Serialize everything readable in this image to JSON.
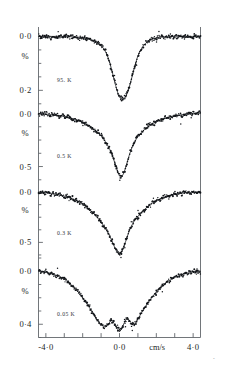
{
  "figure": {
    "type": "moessbauer-spectra-stack",
    "x_axis": {
      "unit_label": "cm/s",
      "tick_labels": [
        "-4·0",
        "0·0",
        "4·0"
      ],
      "tick_values": [
        -4.0,
        0.0,
        4.0
      ],
      "range": [
        -4.4,
        4.4
      ],
      "minor_tick_step": 1.0,
      "n_ticks": 9
    },
    "y_axis_unit": "%",
    "panels": [
      {
        "id": "panel-95k",
        "temperature_label": "95. K",
        "y_top_label": "0·0",
        "y_bottom_label": "0·2",
        "percent_label": "%",
        "y_top_value": 0.0,
        "y_bottom_value": 0.2,
        "depth_percent": 0.235,
        "line_shape": "single-narrow-lorentzian",
        "center_cm_s": 0.25,
        "width_cm_s": 0.95
      },
      {
        "id": "panel-0p5k",
        "temperature_label": "0.5 K",
        "y_top_label": "0·0",
        "y_bottom_label": "0·5",
        "percent_label": "%",
        "y_top_value": 0.0,
        "y_bottom_value": 0.5,
        "depth_percent": 0.6,
        "line_shape": "broadened-single-with-wings",
        "center_cm_s": 0.1,
        "width_cm_s": 1.5
      },
      {
        "id": "panel-0p3k",
        "temperature_label": "0.3 K",
        "y_top_label": "0·0",
        "y_bottom_label": "0·5",
        "percent_label": "%",
        "y_top_value": 0.0,
        "y_bottom_value": 0.5,
        "depth_percent": 0.62,
        "line_shape": "v-shaped-broad-wings",
        "center_cm_s": 0.1,
        "width_cm_s": 2.2
      },
      {
        "id": "panel-0p05k",
        "temperature_label": "0.05 K",
        "y_top_label": "0·0",
        "y_bottom_label": "0·4",
        "percent_label": "%",
        "y_top_value": 0.0,
        "y_bottom_value": 0.4,
        "depth_percent": 0.46,
        "line_shape": "magnetically-split-multiline",
        "center_cm_s": 0.0,
        "width_cm_s": 3.4
      }
    ],
    "corner_mark": "•"
  },
  "chart_data": {
    "type": "line",
    "title": "",
    "xlabel": "cm/s",
    "ylabel": "%",
    "xlim": [
      -4.4,
      4.4
    ],
    "grid": false,
    "legend": "none",
    "panels": [
      {
        "name": "95. K",
        "ylim": [
          0.26,
          -0.035
        ],
        "yticks": [
          0.0,
          0.2
        ],
        "ytick_labels": [
          "0·0",
          "0·2"
        ],
        "x": [
          -4.4,
          -4.0,
          -3.6,
          -3.2,
          -2.8,
          -2.4,
          -2.0,
          -1.8,
          -1.6,
          -1.4,
          -1.2,
          -1.0,
          -0.85,
          -0.7,
          -0.55,
          -0.4,
          -0.25,
          -0.1,
          0.05,
          0.2,
          0.35,
          0.5,
          0.65,
          0.8,
          0.95,
          1.1,
          1.3,
          1.5,
          1.7,
          1.9,
          2.2,
          2.6,
          3.0,
          3.4,
          3.8,
          4.2,
          4.4
        ],
        "absorption": [
          0.0,
          0.0,
          0.0,
          0.0,
          0.0,
          0.002,
          0.004,
          0.006,
          0.01,
          0.016,
          0.024,
          0.034,
          0.046,
          0.064,
          0.092,
          0.13,
          0.172,
          0.208,
          0.228,
          0.233,
          0.222,
          0.196,
          0.158,
          0.118,
          0.082,
          0.056,
          0.034,
          0.02,
          0.012,
          0.007,
          0.003,
          0.001,
          0.0,
          0.0,
          0.0,
          0.0,
          0.0
        ]
      },
      {
        "name": "0.5 K",
        "ylim": [
          0.66,
          -0.09
        ],
        "yticks": [
          0.0,
          0.5
        ],
        "ytick_labels": [
          "0·0",
          "0·5"
        ],
        "x": [
          -4.4,
          -4.0,
          -3.6,
          -3.2,
          -2.8,
          -2.4,
          -2.0,
          -1.7,
          -1.45,
          -1.2,
          -1.0,
          -0.85,
          -0.7,
          -0.55,
          -0.4,
          -0.25,
          -0.12,
          0.0,
          0.12,
          0.25,
          0.4,
          0.55,
          0.7,
          0.9,
          1.1,
          1.35,
          1.6,
          1.9,
          2.2,
          2.6,
          3.0,
          3.4,
          3.8,
          4.2,
          4.4
        ],
        "absorption": [
          0.0,
          0.005,
          0.012,
          0.022,
          0.036,
          0.056,
          0.084,
          0.112,
          0.14,
          0.176,
          0.212,
          0.244,
          0.282,
          0.33,
          0.392,
          0.468,
          0.54,
          0.59,
          0.6,
          0.556,
          0.47,
          0.382,
          0.31,
          0.244,
          0.194,
          0.152,
          0.116,
          0.084,
          0.06,
          0.038,
          0.022,
          0.012,
          0.005,
          0.0,
          0.0
        ]
      },
      {
        "name": "0.3 K",
        "ylim": [
          0.68,
          -0.11
        ],
        "yticks": [
          0.0,
          0.5
        ],
        "ytick_labels": [
          "0·0",
          "0·5"
        ],
        "x": [
          -4.4,
          -4.0,
          -3.6,
          -3.2,
          -2.8,
          -2.5,
          -2.2,
          -1.95,
          -1.7,
          -1.45,
          -1.2,
          -1.0,
          -0.8,
          -0.6,
          -0.45,
          -0.3,
          -0.15,
          0.0,
          0.12,
          0.25,
          0.4,
          0.6,
          0.8,
          1.0,
          1.25,
          1.5,
          1.8,
          2.1,
          2.45,
          2.8,
          3.2,
          3.6,
          4.0,
          4.4
        ],
        "absorption": [
          0.0,
          0.006,
          0.016,
          0.03,
          0.052,
          0.072,
          0.098,
          0.128,
          0.162,
          0.204,
          0.252,
          0.3,
          0.352,
          0.412,
          0.47,
          0.534,
          0.592,
          0.62,
          0.6,
          0.54,
          0.452,
          0.352,
          0.288,
          0.24,
          0.192,
          0.15,
          0.108,
          0.076,
          0.05,
          0.03,
          0.016,
          0.007,
          0.002,
          0.0
        ]
      },
      {
        "name": "0.05 K",
        "ylim": [
          0.5,
          -0.1
        ],
        "yticks": [
          0.0,
          0.4
        ],
        "ytick_labels": [
          "0·0",
          "0·4"
        ],
        "x": [
          -4.4,
          -4.0,
          -3.6,
          -3.3,
          -3.0,
          -2.75,
          -2.5,
          -2.25,
          -2.0,
          -1.8,
          -1.6,
          -1.4,
          -1.2,
          -1.05,
          -0.9,
          -0.75,
          -0.6,
          -0.45,
          -0.3,
          -0.15,
          0.0,
          0.12,
          0.25,
          0.4,
          0.55,
          0.7,
          0.85,
          1.0,
          1.2,
          1.45,
          1.7,
          1.95,
          2.25,
          2.55,
          2.9,
          3.25,
          3.6,
          4.0,
          4.4
        ],
        "absorption": [
          0.0,
          0.008,
          0.022,
          0.038,
          0.06,
          0.086,
          0.118,
          0.156,
          0.2,
          0.24,
          0.282,
          0.326,
          0.368,
          0.396,
          0.414,
          0.42,
          0.4,
          0.366,
          0.392,
          0.43,
          0.455,
          0.436,
          0.392,
          0.35,
          0.372,
          0.404,
          0.396,
          0.362,
          0.312,
          0.258,
          0.208,
          0.164,
          0.12,
          0.084,
          0.054,
          0.032,
          0.016,
          0.005,
          0.0
        ]
      }
    ]
  }
}
